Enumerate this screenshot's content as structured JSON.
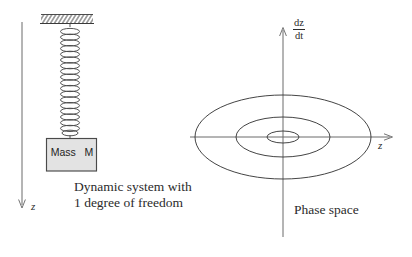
{
  "figure": {
    "background_color": "#ffffff",
    "stroke_color": "#3a3a3a",
    "left_panel": {
      "name": "dynamic-system-diagram",
      "ceiling": {
        "hatched": true
      },
      "spring": {
        "coils": 19
      },
      "mass_block": {
        "label": "Mass   M",
        "fill_color": "#e3e3e3",
        "border_color": "#4a4a4a"
      },
      "axis": {
        "label": "z",
        "direction": "down"
      },
      "caption_line_1": "Dynamic system with",
      "caption_line_2": "1 degree of freedom"
    },
    "right_panel": {
      "name": "phase-space-diagram",
      "vertical_axis": {
        "numerator": "dz",
        "denominator": "dt",
        "direction": "up"
      },
      "horizontal_axis": {
        "label": "z",
        "direction": "right"
      },
      "trajectories": [
        {
          "name": "outer-orbit",
          "rx": 88,
          "ry": 42
        },
        {
          "name": "middle-orbit",
          "rx": 47,
          "ry": 20
        },
        {
          "name": "inner-orbit",
          "rx": 16,
          "ry": 6
        }
      ],
      "caption": "Phase space"
    }
  }
}
